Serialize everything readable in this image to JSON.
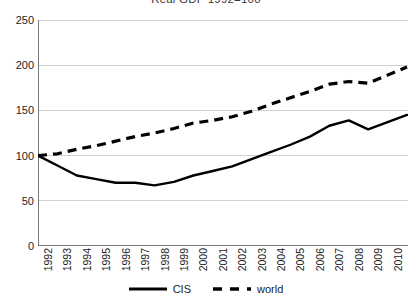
{
  "chart_data": {
    "type": "line",
    "title": "Real GDP 1992=100",
    "xlabel": "",
    "ylabel": "",
    "ylim": [
      0,
      250
    ],
    "yticks": [
      0,
      50,
      100,
      150,
      200,
      250
    ],
    "xlim": [
      1992,
      2011
    ],
    "grid": true,
    "legend_position": "bottom",
    "categories": [
      "1992",
      "1993",
      "1994",
      "1995",
      "1996",
      "1997",
      "1998",
      "1999",
      "2000",
      "2001",
      "2002",
      "2003",
      "2004",
      "2005",
      "2006",
      "2007",
      "2008",
      "2009",
      "2010",
      "2011"
    ],
    "x": [
      1992,
      1993,
      1994,
      1995,
      1996,
      1997,
      1998,
      1999,
      2000,
      2001,
      2002,
      2003,
      2004,
      2005,
      2006,
      2007,
      2008,
      2009,
      2010,
      2011
    ],
    "series": [
      {
        "name": "CIS",
        "style": "solid",
        "color": "#000000",
        "values": [
          100,
          89,
          78,
          74,
          70,
          70,
          67,
          71,
          78,
          83,
          88,
          96,
          104,
          112,
          121,
          133,
          139,
          129,
          137,
          145
        ]
      },
      {
        "name": "world",
        "style": "dashed",
        "color": "#000000",
        "values": [
          100,
          102,
          107,
          111,
          116,
          121,
          125,
          130,
          136,
          139,
          143,
          149,
          157,
          164,
          171,
          179,
          182,
          180,
          189,
          198
        ]
      }
    ]
  },
  "legend": {
    "entries": [
      {
        "label": "CIS",
        "style": "solid"
      },
      {
        "label": "world",
        "style": "dashed"
      }
    ]
  },
  "colors": {
    "line": "#000000",
    "grid": "#d2d2d2",
    "axis": "#7a7a7a",
    "text": "#232323",
    "background": "#ffffff"
  }
}
